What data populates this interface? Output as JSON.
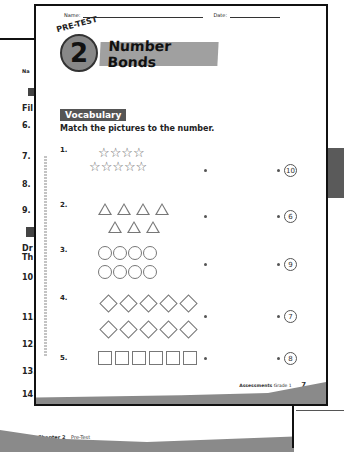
{
  "back_page": {
    "header_fragment": "Na",
    "section_fragment": "Fil",
    "items": [
      "6.",
      "7.",
      "8.",
      "9.",
      "10",
      "11.",
      "12.",
      "13.",
      "14"
    ],
    "directions_fragment": [
      "Dr",
      "Th"
    ],
    "footer": {
      "page_number": "8",
      "chapter": "Chapter 2",
      "label": "Pre-Test"
    }
  },
  "front_page": {
    "name_label": "Name:",
    "date_label": "Date:",
    "badge_label": "PRE-TEST",
    "chapter_number": "2",
    "title": "Number Bonds",
    "section": "Vocabulary",
    "instructions": "Match the pictures to the number.",
    "items": [
      {
        "number": "1.",
        "shape": "star",
        "rows": [
          4,
          5
        ],
        "answer": "10"
      },
      {
        "number": "2.",
        "shape": "triangle",
        "rows": [
          4,
          3
        ],
        "answer": "6"
      },
      {
        "number": "3.",
        "shape": "circle",
        "rows": [
          4,
          4
        ],
        "answer": "9"
      },
      {
        "number": "4.",
        "shape": "diamond",
        "rows": [
          5,
          5
        ],
        "answer": "7"
      },
      {
        "number": "5.",
        "shape": "square",
        "rows": [
          6
        ],
        "answer": "8"
      }
    ],
    "footer": {
      "label": "Assessments",
      "grade": "Grade 1",
      "page_number": "7"
    }
  }
}
